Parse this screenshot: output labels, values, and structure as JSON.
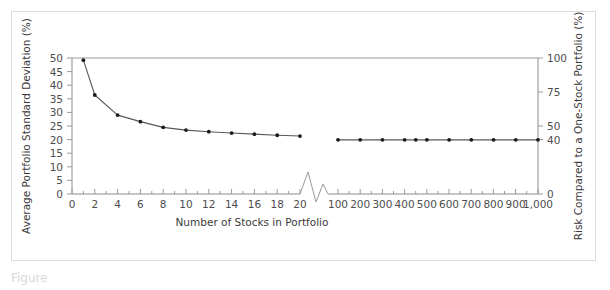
{
  "figure": {
    "caption_label": "Figure",
    "caption_number": "7.2"
  },
  "chart_data": {
    "type": "line",
    "title": "",
    "xlabel": "Number of Stocks in Portfolio",
    "ylabel": "Average Portfolio Standard Deviation (%)",
    "y2label": "Risk Compared to a One-Stock Portfolio (%)",
    "grid": false,
    "legend": "none",
    "axis_break": true,
    "axis_break_note": "x-axis broken between 20 and 100 stocks",
    "ylim": [
      0,
      50
    ],
    "yticks": [
      0,
      5,
      10,
      15,
      20,
      25,
      30,
      35,
      40,
      45,
      50
    ],
    "yticklabels": [
      "0",
      "5",
      "10",
      "15",
      "20",
      "25",
      "30",
      "35",
      "40",
      "45",
      "50"
    ],
    "y2lim": [
      0,
      100
    ],
    "y2ticks": [
      0,
      40,
      50,
      75,
      100
    ],
    "y2ticklabels": [
      "0",
      "40",
      "50",
      "75",
      "100"
    ],
    "xticks_left": [
      0,
      2,
      4,
      6,
      8,
      10,
      12,
      14,
      16,
      18,
      20
    ],
    "xticklabels_left": [
      "0",
      "2",
      "4",
      "6",
      "8",
      "10",
      "12",
      "14",
      "16",
      "18",
      "20"
    ],
    "xticks_right": [
      100,
      200,
      300,
      400,
      500,
      600,
      700,
      800,
      900,
      1000
    ],
    "xticklabels_right": [
      "100",
      "200",
      "300",
      "400",
      "500",
      "600",
      "700",
      "800",
      "900",
      "1,000"
    ],
    "series": [
      {
        "name": "Average portfolio standard deviation",
        "segment": "left",
        "x": [
          1,
          2,
          4,
          6,
          8,
          10,
          12,
          14,
          16,
          18,
          20
        ],
        "y": [
          49.2,
          36.4,
          29.0,
          26.6,
          24.5,
          23.5,
          22.9,
          22.4,
          22.0,
          21.6,
          21.3
        ]
      },
      {
        "name": "Average portfolio standard deviation",
        "segment": "right",
        "x": [
          100,
          200,
          300,
          400,
          450,
          500,
          600,
          700,
          800,
          900,
          1000
        ],
        "y": [
          19.9,
          19.9,
          19.9,
          19.9,
          19.9,
          19.9,
          19.9,
          19.9,
          19.9,
          19.9,
          19.9
        ]
      }
    ]
  }
}
